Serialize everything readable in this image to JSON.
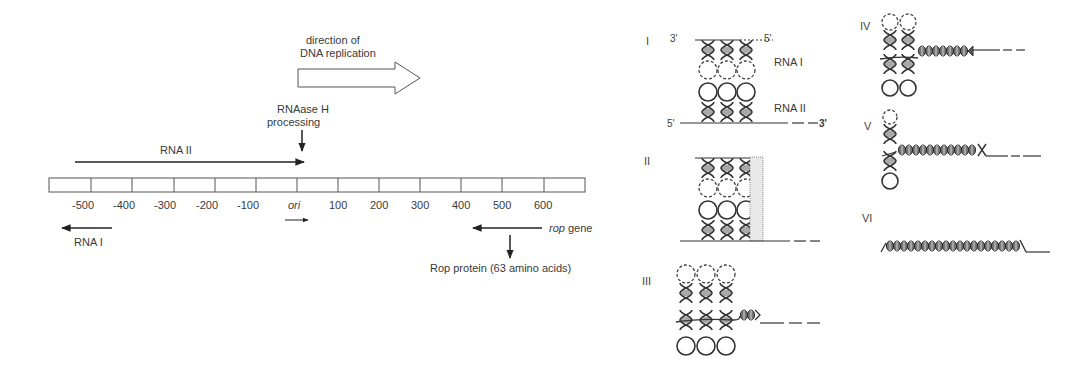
{
  "left_panel": {
    "replication_direction": {
      "line1": "direction of",
      "line2": "DNA replication"
    },
    "rnaase": {
      "line1": "RNAase H",
      "line2": "processing"
    },
    "rna_ii_label": "RNA II",
    "rna_i_label": "RNA I",
    "ruler_ticks": [
      "-500",
      "-400",
      "-300",
      "-200",
      "-100",
      "ori",
      "100",
      "200",
      "300",
      "400",
      "500",
      "600"
    ],
    "rop_gene": {
      "italic": "rop",
      "rest": " gene"
    },
    "rop_protein": "Rop protein (63 amino acids)"
  },
  "right_panel": {
    "stages": [
      {
        "numeral": "I"
      },
      {
        "numeral": "II"
      },
      {
        "numeral": "III"
      },
      {
        "numeral": "IV"
      },
      {
        "numeral": "V"
      },
      {
        "numeral": "VI"
      }
    ],
    "stage1": {
      "three_prime_top": "3'",
      "five_prime_top": "5'",
      "rna_i": "RNA I",
      "rna_ii": "RNA II",
      "five_prime_bottom": "5'",
      "three_prime_bottom": "3'"
    }
  }
}
